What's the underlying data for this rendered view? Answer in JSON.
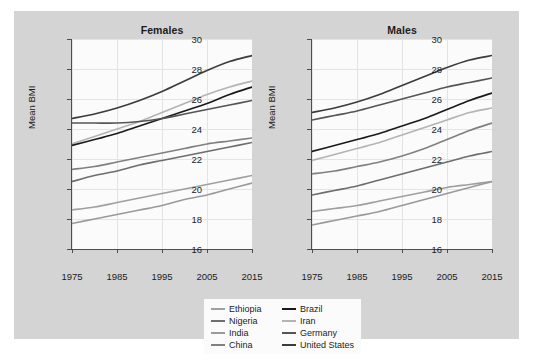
{
  "figure": {
    "background_color": "#d4d4d4",
    "plot_background_color": "#fbfbfb",
    "grid_color": "#e3e3e8",
    "axis_color": "#4d4d4d"
  },
  "panels": [
    {
      "id": "females",
      "title": "Females"
    },
    {
      "id": "males",
      "title": "Males"
    }
  ],
  "axes": {
    "ylabel": "Mean BMI",
    "xlabel": "",
    "yticks": [
      16,
      18,
      20,
      22,
      24,
      26,
      28,
      30
    ],
    "ytick_labels": [
      "16",
      "18",
      "20",
      "22",
      "24",
      "26",
      "28",
      "30"
    ],
    "xticks": [
      1975,
      1985,
      1995,
      2005,
      2015
    ],
    "xtick_labels": [
      "1975",
      "1985",
      "1995",
      "2005",
      "2015"
    ],
    "ylim": [
      16,
      30
    ],
    "xlim": [
      1975,
      2015
    ],
    "grid": true
  },
  "legend": {
    "position": "bottom-center",
    "items": [
      {
        "label": "Ethiopia",
        "color": "#a0a0a0"
      },
      {
        "label": "Brazil",
        "color": "#1a1a1a"
      },
      {
        "label": "Nigeria",
        "color": "#6e6e6e"
      },
      {
        "label": "Iran",
        "color": "#b4b4b4"
      },
      {
        "label": "India",
        "color": "#9a9a9a"
      },
      {
        "label": "Germany",
        "color": "#555555"
      },
      {
        "label": "China",
        "color": "#808080"
      },
      {
        "label": "United States",
        "color": "#3c3c3c"
      }
    ]
  },
  "chart_data": {
    "type": "line",
    "title": "",
    "xlabel": "",
    "ylabel": "Mean BMI",
    "xlim": [
      1975,
      2015
    ],
    "ylim": [
      16,
      30
    ],
    "grid": true,
    "legend_position": "bottom-center",
    "x": [
      1975,
      1980,
      1985,
      1990,
      1995,
      2000,
      2005,
      2010,
      2015
    ],
    "panels": [
      {
        "name": "Females",
        "series": [
          {
            "name": "United States",
            "color": "#3c3c3c",
            "values": [
              24.7,
              25.0,
              25.4,
              25.9,
              26.5,
              27.2,
              27.9,
              28.5,
              28.9
            ]
          },
          {
            "name": "Iran",
            "color": "#b4b4b4",
            "values": [
              23.0,
              23.5,
              24.0,
              24.5,
              25.1,
              25.7,
              26.3,
              26.8,
              27.2
            ]
          },
          {
            "name": "Brazil",
            "color": "#1a1a1a",
            "values": [
              22.9,
              23.3,
              23.7,
              24.2,
              24.7,
              25.2,
              25.7,
              26.3,
              26.8
            ]
          },
          {
            "name": "Germany",
            "color": "#555555",
            "values": [
              24.4,
              24.4,
              24.4,
              24.5,
              24.7,
              25.0,
              25.3,
              25.6,
              25.9
            ]
          },
          {
            "name": "China",
            "color": "#808080",
            "values": [
              21.3,
              21.5,
              21.8,
              22.1,
              22.4,
              22.7,
              23.0,
              23.2,
              23.4
            ]
          },
          {
            "name": "Nigeria",
            "color": "#6e6e6e",
            "values": [
              20.5,
              20.9,
              21.2,
              21.6,
              21.9,
              22.2,
              22.5,
              22.8,
              23.1
            ]
          },
          {
            "name": "Ethiopia",
            "color": "#a0a0a0",
            "values": [
              18.6,
              18.8,
              19.1,
              19.4,
              19.7,
              20.0,
              20.3,
              20.6,
              20.9
            ]
          },
          {
            "name": "India",
            "color": "#9a9a9a",
            "values": [
              17.7,
              18.0,
              18.3,
              18.6,
              18.9,
              19.3,
              19.6,
              20.0,
              20.4
            ]
          }
        ]
      },
      {
        "name": "Males",
        "series": [
          {
            "name": "United States",
            "color": "#3c3c3c",
            "values": [
              25.1,
              25.4,
              25.8,
              26.3,
              26.9,
              27.5,
              28.1,
              28.6,
              28.9
            ]
          },
          {
            "name": "Germany",
            "color": "#555555",
            "values": [
              24.6,
              24.9,
              25.2,
              25.6,
              26.0,
              26.4,
              26.8,
              27.1,
              27.4
            ]
          },
          {
            "name": "Brazil",
            "color": "#1a1a1a",
            "values": [
              22.5,
              22.9,
              23.3,
              23.7,
              24.2,
              24.7,
              25.3,
              25.9,
              26.4
            ]
          },
          {
            "name": "Iran",
            "color": "#b4b4b4",
            "values": [
              21.9,
              22.3,
              22.7,
              23.1,
              23.6,
              24.1,
              24.6,
              25.1,
              25.4
            ]
          },
          {
            "name": "China",
            "color": "#808080",
            "values": [
              21.0,
              21.2,
              21.5,
              21.8,
              22.2,
              22.7,
              23.3,
              23.9,
              24.4
            ]
          },
          {
            "name": "Nigeria",
            "color": "#6e6e6e",
            "values": [
              19.6,
              19.9,
              20.2,
              20.6,
              21.0,
              21.4,
              21.8,
              22.2,
              22.5
            ]
          },
          {
            "name": "Ethiopia",
            "color": "#a0a0a0",
            "values": [
              18.5,
              18.7,
              18.9,
              19.2,
              19.5,
              19.8,
              20.1,
              20.3,
              20.5
            ]
          },
          {
            "name": "India",
            "color": "#9a9a9a",
            "values": [
              17.6,
              17.9,
              18.2,
              18.5,
              18.9,
              19.3,
              19.7,
              20.1,
              20.5
            ]
          }
        ]
      }
    ]
  }
}
